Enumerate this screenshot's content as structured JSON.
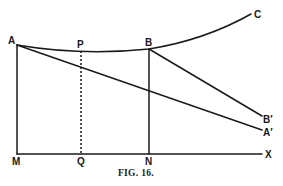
{
  "figure": {
    "caption": "FIG. 16.",
    "labels": {
      "A": "A",
      "P": "P",
      "B": "B",
      "C": "C",
      "B_prime": "B′",
      "A_prime": "A′",
      "M": "M",
      "Q": "Q",
      "N": "N",
      "X": "X"
    },
    "points": {
      "A": [
        17,
        45
      ],
      "P": [
        81,
        50
      ],
      "B": [
        149,
        49
      ],
      "C": [
        253,
        13
      ],
      "B_prime": [
        266,
        118
      ],
      "A_prime": [
        266,
        131
      ],
      "M": [
        17,
        154
      ],
      "Q": [
        81,
        154
      ],
      "N": [
        149,
        154
      ],
      "X": [
        262,
        154
      ]
    },
    "segments": [
      {
        "from": "A",
        "to": "M",
        "style": "solid"
      },
      {
        "from": "P",
        "to": "Q",
        "style": "dotted"
      },
      {
        "from": "B",
        "to": "N",
        "style": "solid"
      },
      {
        "from": "M",
        "to": "X",
        "style": "solid"
      },
      {
        "from": "A",
        "to": "A_prime",
        "style": "solid"
      },
      {
        "from": "B",
        "to": "B_prime",
        "style": "solid"
      }
    ],
    "curve": {
      "through": [
        "A",
        "P",
        "B",
        "C"
      ]
    }
  }
}
